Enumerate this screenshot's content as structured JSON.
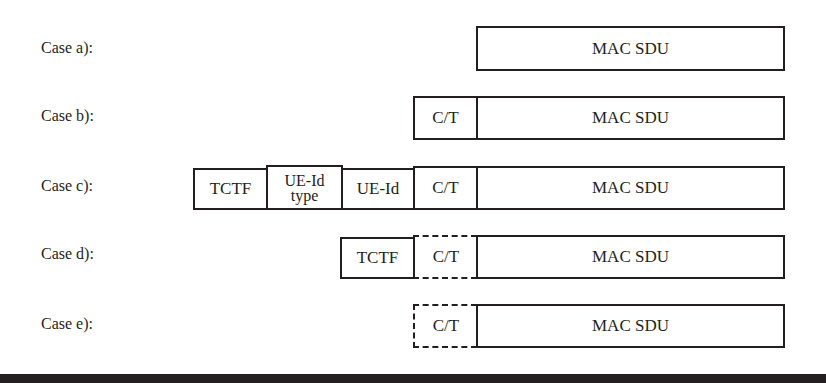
{
  "cases": [
    {
      "label": "Case a):",
      "fields": [
        {
          "text": "MAC SDU",
          "style": "solid"
        }
      ]
    },
    {
      "label": "Case b):",
      "fields": [
        {
          "text": "C/T",
          "style": "solid"
        },
        {
          "text": "MAC SDU",
          "style": "solid"
        }
      ]
    },
    {
      "label": "Case c):",
      "fields": [
        {
          "text": "TCTF",
          "style": "solid"
        },
        {
          "text": "UE-Id",
          "text2": "type",
          "style": "solid"
        },
        {
          "text": "UE-Id",
          "style": "solid"
        },
        {
          "text": "C/T",
          "style": "solid"
        },
        {
          "text": "MAC SDU",
          "style": "solid"
        }
      ]
    },
    {
      "label": "Case d):",
      "fields": [
        {
          "text": "TCTF",
          "style": "solid"
        },
        {
          "text": "C/T",
          "style": "dashed"
        },
        {
          "text": "MAC SDU",
          "style": "solid"
        }
      ]
    },
    {
      "label": "Case e):",
      "fields": [
        {
          "text": "C/T",
          "style": "dashed"
        },
        {
          "text": "MAC SDU",
          "style": "solid"
        }
      ]
    }
  ]
}
